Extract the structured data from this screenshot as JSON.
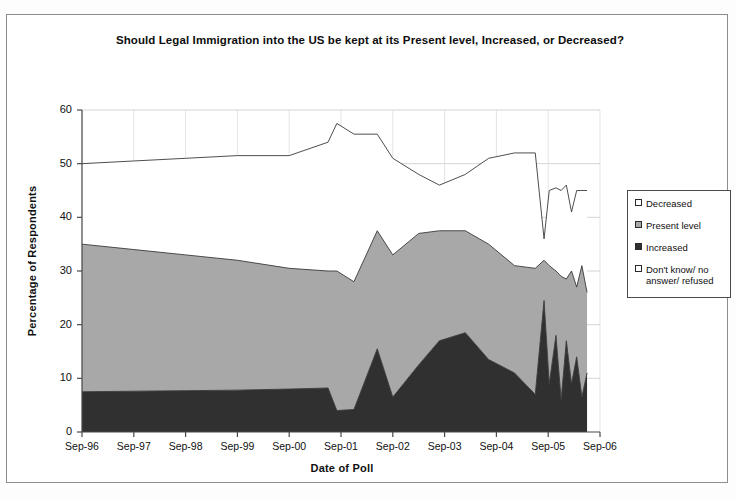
{
  "chart_data": {
    "type": "area",
    "stacked": true,
    "title": "Should Legal Immigration into the US be kept at its Present level, Increased, or Decreased?",
    "xlabel": "Date of Poll",
    "ylabel": "Percentage of Respondents",
    "ylim": [
      0,
      60
    ],
    "yticks": [
      0,
      10,
      20,
      30,
      40,
      50,
      60
    ],
    "xticks": [
      "Sep-96",
      "Sep-97",
      "Sep-98",
      "Sep-99",
      "Sep-00",
      "Sep-01",
      "Sep-02",
      "Sep-03",
      "Sep-04",
      "Sep-05",
      "Sep-06"
    ],
    "xlim": [
      1996.7,
      2006.7
    ],
    "grid": true,
    "legend_position": "right",
    "colors": {
      "decreased": "#ffffff",
      "present_level": "#a8a8a8",
      "increased": "#303030",
      "dont_know": "#ffffff",
      "line": "#3a3a3a"
    },
    "x": [
      1996.7,
      1997.7,
      1998.7,
      1999.7,
      2000.7,
      2001.45,
      2001.62,
      2001.95,
      2002.4,
      2002.7,
      2003.2,
      2003.6,
      2004.1,
      2004.55,
      2005.05,
      2005.45,
      2005.62,
      2005.72,
      2005.85,
      2005.95,
      2006.05,
      2006.15,
      2006.25,
      2006.35,
      2006.45
    ],
    "series": [
      {
        "name": "Increased",
        "values": [
          7.5,
          7.6,
          7.7,
          7.8,
          8.0,
          8.2,
          4.0,
          4.2,
          15.5,
          6.5,
          12.5,
          17.0,
          18.5,
          13.5,
          11.0,
          7.0,
          24.5,
          9.0,
          18.0,
          6.0,
          17.0,
          9.0,
          14.0,
          6.5,
          11.0
        ]
      },
      {
        "name": "Present level",
        "values": [
          27.5,
          26.4,
          25.3,
          24.2,
          22.5,
          21.8,
          26.0,
          23.8,
          22.0,
          26.5,
          24.5,
          20.5,
          19.0,
          21.5,
          20.0,
          23.5,
          7.5,
          22.0,
          12.0,
          23.0,
          11.5,
          21.0,
          13.0,
          24.5,
          15.0
        ]
      },
      {
        "name": "Decreased",
        "values": [
          15.0,
          16.5,
          18.0,
          19.5,
          21.0,
          24.0,
          27.5,
          27.5,
          18.5,
          18.0,
          11.0,
          8.5,
          10.5,
          16.0,
          21.0,
          21.5,
          4.0,
          14.0,
          15.5,
          16.0,
          17.5,
          11.0,
          18.0,
          14.0,
          19.0
        ]
      },
      {
        "name": "Don't know/ no answer/ refused",
        "values": [
          50.0,
          49.5,
          49.0,
          48.5,
          48.5,
          46.0,
          42.5,
          44.5,
          44.0,
          49.0,
          52.0,
          54.0,
          52.0,
          49.0,
          48.0,
          48.0,
          64.0,
          55.0,
          54.5,
          55.0,
          54.0,
          59.0,
          55.0,
          55.0,
          55.0
        ]
      }
    ],
    "cumulative_boundaries_note": "Top of Increased band, top of Present level band, and top of Decreased band as percentage of respondents",
    "top_of_increased": [
      7.5,
      7.6,
      7.7,
      7.8,
      8.0,
      8.2,
      4.0,
      4.2,
      15.5,
      6.5,
      12.5,
      17.0,
      18.5,
      13.5,
      11.0,
      7.0,
      24.5,
      9.0,
      18.0,
      6.0,
      17.0,
      9.0,
      14.0,
      6.5,
      11.0
    ],
    "top_of_present_level": [
      35.0,
      34.0,
      33.0,
      32.0,
      30.5,
      30.0,
      30.0,
      28.0,
      37.5,
      33.0,
      37.0,
      37.5,
      37.5,
      35.0,
      31.0,
      30.5,
      32.0,
      31.0,
      30.0,
      29.0,
      28.5,
      30.0,
      27.0,
      31.0,
      26.0
    ],
    "top_of_decreased": [
      50.0,
      50.5,
      51.0,
      51.5,
      51.5,
      54.0,
      57.5,
      55.5,
      55.5,
      51.0,
      48.0,
      46.0,
      48.0,
      51.0,
      52.0,
      52.0,
      36.0,
      45.0,
      45.5,
      45.0,
      46.0,
      41.0,
      45.0,
      45.0,
      45.0
    ]
  },
  "legend": {
    "items": [
      {
        "label": "Decreased",
        "swatch": "sw-decreased"
      },
      {
        "label": "Present level",
        "swatch": "sw-present"
      },
      {
        "label": "Increased",
        "swatch": "sw-increased"
      },
      {
        "label": "Don't know/ no answer/ refused",
        "swatch": "sw-dontknow"
      }
    ]
  }
}
